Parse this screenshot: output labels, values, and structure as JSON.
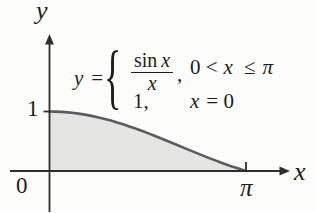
{
  "colors": {
    "background": "#fcfcfa",
    "axis": "#2e2e2e",
    "curve": "#5c5c5e",
    "area_fill": "#e5e5e3",
    "text": "#1d1d1d"
  },
  "labels": {
    "y_axis": "y",
    "x_axis": "x",
    "origin": "0",
    "one": "1",
    "pi": "π"
  },
  "equation": {
    "lhs_var": "y",
    "lhs_equals": "=",
    "brace": "{",
    "case1": {
      "numerator_fn": "sin",
      "numerator_var": "x",
      "denominator": "x",
      "comma": ",",
      "condition_pre": "0 <",
      "condition_var": "x",
      "condition_rel": "≤",
      "condition_pi": "π"
    },
    "case2": {
      "value": "1,",
      "condition_var": "x",
      "condition_rest": "= 0"
    }
  },
  "chart_data": {
    "type": "area",
    "title": "",
    "xlabel": "x",
    "ylabel": "y",
    "annotation": "y = { sin x / x , 0 < x ≤ π ; 1 , x = 0 }",
    "shaded_region": "area under y = sin(x)/x between x = 0 and x = π",
    "grid": false,
    "legend": "none",
    "xlim": [
      -0.65,
      3.9
    ],
    "ylim": [
      -0.7,
      2.3
    ],
    "x_ticks": [
      {
        "value": 3.1416,
        "label": "π"
      }
    ],
    "y_ticks": [
      {
        "value": 1,
        "label": "1"
      }
    ],
    "x": [
      0,
      0.0982,
      0.1963,
      0.2945,
      0.3927,
      0.4909,
      0.589,
      0.6872,
      0.7854,
      0.8836,
      0.9817,
      1.0799,
      1.1781,
      1.2763,
      1.3744,
      1.4726,
      1.5708,
      1.669,
      1.7671,
      1.8653,
      1.9635,
      2.0617,
      2.1598,
      2.258,
      2.3562,
      2.4544,
      2.5525,
      2.6507,
      2.7489,
      2.8471,
      2.9452,
      3.0434,
      3.1416
    ],
    "y": [
      1,
      0.9984,
      0.9936,
      0.9856,
      0.9745,
      0.9603,
      0.9432,
      0.9231,
      0.9003,
      0.8749,
      0.8469,
      0.8167,
      0.7842,
      0.7498,
      0.7136,
      0.6758,
      0.6366,
      0.5963,
      0.555,
      0.513,
      0.4705,
      0.4278,
      0.385,
      0.3423,
      0.3001,
      0.2585,
      0.2176,
      0.1778,
      0.1392,
      0.102,
      0.0662,
      0.0322,
      0
    ]
  }
}
